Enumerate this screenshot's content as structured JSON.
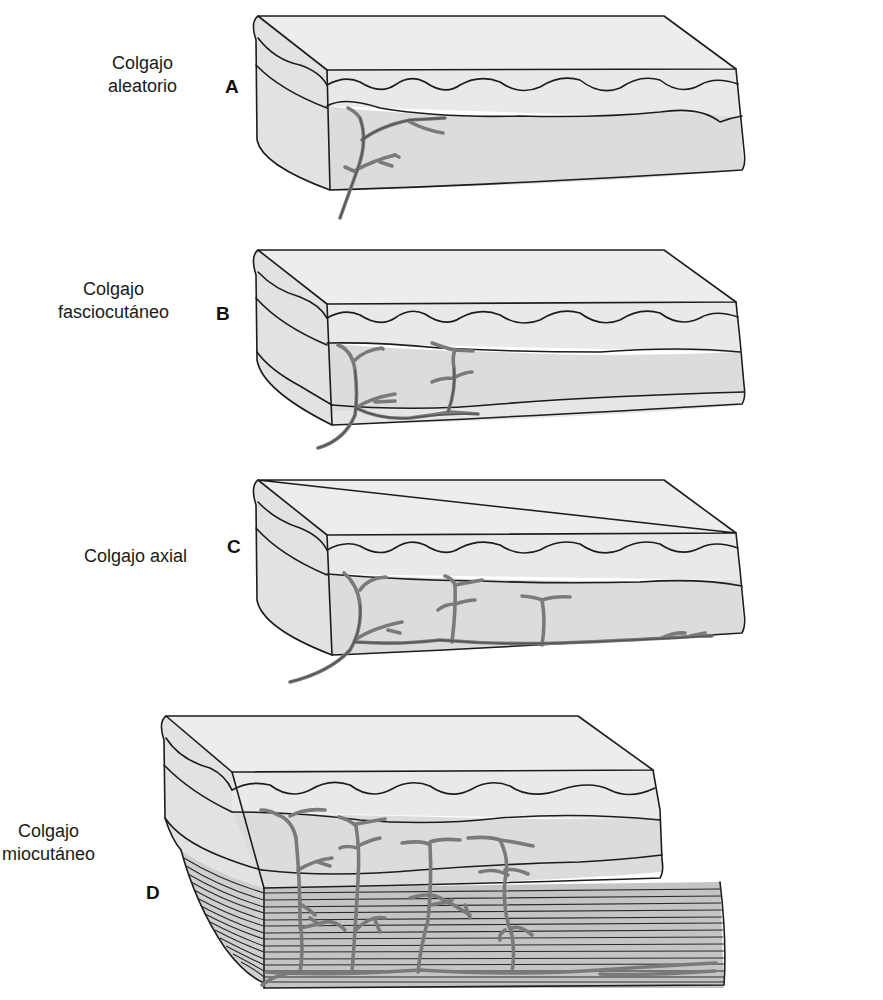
{
  "figure": {
    "panels": [
      {
        "letter": "A",
        "title_line1": "Colgajo",
        "title_line2": "aleatorio"
      },
      {
        "letter": "B",
        "title_line1": "Colgajo",
        "title_line2": "fasciocutáneo"
      },
      {
        "letter": "C",
        "title_line1": "Colgajo axial",
        "title_line2": ""
      },
      {
        "letter": "D",
        "title_line1": "Colgajo",
        "title_line2": "miocutáneo"
      }
    ]
  },
  "colors": {
    "outline": "#1c1c1c",
    "tissue_light": "#ededed",
    "tissue_fat": "#dcdcdc",
    "muscle": "#c4c4c4",
    "vessel": "#7a7a7a"
  }
}
